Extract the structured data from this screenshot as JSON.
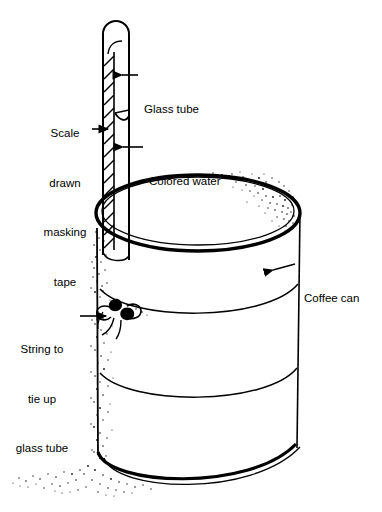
{
  "figure": {
    "type": "technical-line-diagram",
    "background_color": "#ffffff",
    "ink_color": "#000000",
    "labels": [
      {
        "id": "glass-tube",
        "text": "Glass tube",
        "lines": [
          "Glass tube"
        ],
        "align": "left",
        "points_to": "glass tube wall, upper section",
        "leader": "horizontal line with left-pointing arrowhead"
      },
      {
        "id": "scale-masking-tape",
        "text": "Scale drawn masking tape",
        "lines": [
          "Scale",
          "drawn",
          "masking",
          "tape"
        ],
        "align": "center",
        "points_to": "hatched tape strip on left side of tube",
        "leader": "short horizontal line with right-pointing arrowhead"
      },
      {
        "id": "colored-water",
        "text": "Colored water",
        "lines": [
          "Colored water"
        ],
        "align": "left",
        "points_to": "water column below meniscus inside tube",
        "leader": "horizontal line with left-pointing arrowhead"
      },
      {
        "id": "coffee-can",
        "text": "Coffee can",
        "lines": [
          "Coffee can"
        ],
        "align": "left",
        "points_to": "upper right side wall of the can",
        "leader": "horizontal line with left-pointing arrowhead"
      },
      {
        "id": "string-tie",
        "text": "String to tie up glass tube",
        "lines": [
          "String to",
          "tie up",
          "glass tube"
        ],
        "align": "center",
        "points_to": "string bow knot tying tube to can",
        "leader": "horizontal line with right-pointing arrowhead"
      }
    ],
    "parts": [
      {
        "id": "glass-tube",
        "name": "glass tube",
        "detail": "long vertical tube with rounded sealed top, extends above the can and down its front-left side"
      },
      {
        "id": "masking-tape",
        "name": "masking tape scale",
        "detail": "diagonally hatched strip along left face of tube"
      },
      {
        "id": "meniscus",
        "name": "water level meniscus",
        "detail": "curved line across tube interior"
      },
      {
        "id": "colored-water",
        "name": "colored water column",
        "detail": "liquid filling tube below the meniscus"
      },
      {
        "id": "coffee-can",
        "name": "coffee can",
        "detail": "cylinder with elliptical rim, two body bands and a base rim"
      },
      {
        "id": "string-knot",
        "name": "string bow knot",
        "detail": "bow with two loops and trailing ends on the can's left side"
      },
      {
        "id": "stipple",
        "name": "stipple shading",
        "detail": "speckled texture on left of can, inside the rim and on the ground"
      }
    ]
  }
}
